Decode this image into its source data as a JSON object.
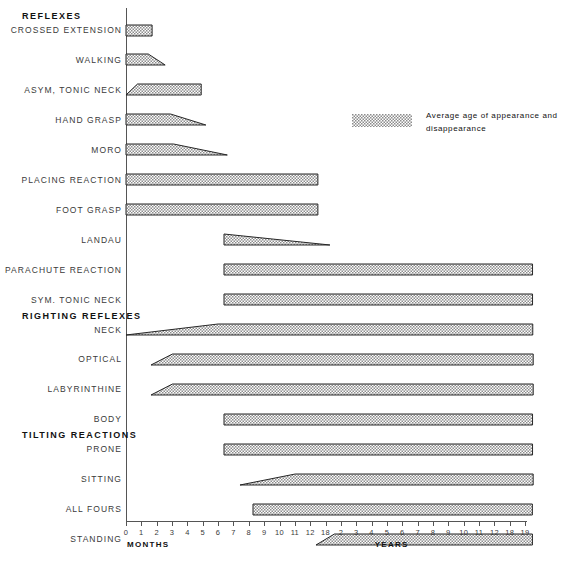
{
  "chart_data": {
    "type": "bar",
    "title": "",
    "xlabel_left": "MONTHS",
    "xlabel_right": "YEARS",
    "grid": false,
    "legend_position": "top-right",
    "legend": [
      {
        "label": "Average age of appearance and disappearance",
        "swatch": "stipple-hatch"
      }
    ],
    "x_axis": {
      "units": [
        "months",
        "years"
      ],
      "tick_labels": [
        "0",
        "1",
        "2",
        "3",
        "4",
        "5",
        "6",
        "7",
        "8",
        "9",
        "10",
        "11",
        "12",
        "18",
        "2",
        "3",
        "4",
        "5",
        "6",
        "7",
        "8",
        "9",
        "10",
        "11",
        "12",
        "18",
        "19"
      ],
      "months_ticks": [
        "0",
        "1",
        "2",
        "3",
        "4",
        "5",
        "6",
        "7",
        "8",
        "9",
        "10",
        "11",
        "12",
        "18"
      ],
      "years_ticks": [
        "2",
        "3",
        "4",
        "5",
        "6",
        "7",
        "8",
        "9",
        "10",
        "11",
        "12",
        "18",
        "19"
      ],
      "n_ticks": 27
    },
    "groups": [
      {
        "name": "REFLEXES",
        "tick_index": 0
      },
      {
        "name": "RIGHTING REFLEXES",
        "tick_index": 10
      },
      {
        "name": "TILTING REACTIONS",
        "tick_index": 15
      }
    ],
    "rows": [
      {
        "label": "CROSSED EXTENSION",
        "group": "REFLEXES",
        "start_tick": 0,
        "full_from": 0,
        "full_to": 1.7,
        "end_tick": 1.7,
        "shape": "box"
      },
      {
        "label": "WALKING",
        "group": "REFLEXES",
        "start_tick": 0,
        "full_from": 0,
        "full_to": 1.45,
        "end_tick": 2.55,
        "shape": "fade-out"
      },
      {
        "label": "ASYM, TONIC NECK",
        "group": "REFLEXES",
        "start_tick": 0,
        "full_from": 0.75,
        "full_to": 4.9,
        "end_tick": 4.9,
        "shape": "fade-in"
      },
      {
        "label": "HAND GRASP",
        "group": "REFLEXES",
        "start_tick": 0,
        "full_from": 0,
        "full_to": 2.9,
        "end_tick": 5.2,
        "shape": "fade-out"
      },
      {
        "label": "MORO",
        "group": "REFLEXES",
        "start_tick": 0,
        "full_from": 0,
        "full_to": 3.1,
        "end_tick": 6.6,
        "shape": "fade-out"
      },
      {
        "label": "PLACING REACTION",
        "group": "REFLEXES",
        "start_tick": 0,
        "full_from": 0,
        "full_to": 12.5,
        "end_tick": 12.5,
        "shape": "box"
      },
      {
        "label": "FOOT GRASP",
        "group": "REFLEXES",
        "start_tick": 0,
        "full_from": 0,
        "full_to": 12.5,
        "end_tick": 12.5,
        "shape": "box"
      },
      {
        "label": "LANDAU",
        "group": "REFLEXES",
        "start_tick": 6.4,
        "full_from": 6.4,
        "full_to": 6.4,
        "end_tick": 13.3,
        "shape": "fade-out"
      },
      {
        "label": "PARACHUTE REACTION",
        "group": "REFLEXES",
        "start_tick": 6.4,
        "full_from": 6.4,
        "full_to": 26.5,
        "end_tick": 26.5,
        "shape": "box"
      },
      {
        "label": "SYM. TONIC NECK",
        "group": "REFLEXES",
        "start_tick": 6.4,
        "full_from": 6.4,
        "full_to": 26.5,
        "end_tick": 26.5,
        "shape": "box"
      },
      {
        "label": "NECK",
        "group": "RIGHTING REFLEXES",
        "start_tick": 0,
        "full_from": 6.0,
        "full_to": 26.5,
        "end_tick": 26.5,
        "shape": "fade-in"
      },
      {
        "label": "OPTICAL",
        "group": "RIGHTING REFLEXES",
        "start_tick": 1.6,
        "full_from": 3.0,
        "full_to": 26.5,
        "end_tick": 26.5,
        "shape": "fade-in"
      },
      {
        "label": "LABYRINTHINE",
        "group": "RIGHTING REFLEXES",
        "start_tick": 1.6,
        "full_from": 3.0,
        "full_to": 26.5,
        "end_tick": 26.5,
        "shape": "fade-in"
      },
      {
        "label": "BODY",
        "group": "RIGHTING REFLEXES",
        "start_tick": 6.4,
        "full_from": 6.4,
        "full_to": 26.5,
        "end_tick": 26.5,
        "shape": "box"
      },
      {
        "label": "PRONE",
        "group": "TILTING REACTIONS",
        "start_tick": 6.4,
        "full_from": 6.4,
        "full_to": 26.5,
        "end_tick": 26.5,
        "shape": "box"
      },
      {
        "label": "SITTING",
        "group": "TILTING REACTIONS",
        "start_tick": 7.4,
        "full_from": 11.0,
        "full_to": 26.5,
        "end_tick": 26.5,
        "shape": "fade-in"
      },
      {
        "label": "ALL FOURS",
        "group": "TILTING REACTIONS",
        "start_tick": 8.3,
        "full_from": 8.3,
        "full_to": 26.5,
        "end_tick": 26.5,
        "shape": "box"
      },
      {
        "label": "STANDING",
        "group": "TILTING REACTIONS",
        "start_tick": 12.4,
        "full_from": 13.6,
        "full_to": 26.5,
        "end_tick": 26.5,
        "shape": "fade-in"
      }
    ]
  }
}
